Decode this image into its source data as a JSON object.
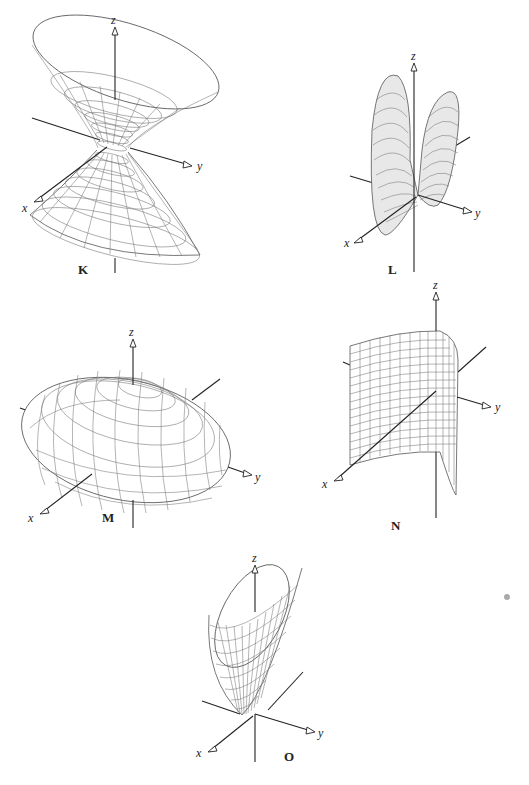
{
  "panels": [
    {
      "id": "K",
      "caption": "K",
      "surface": "hyperboloid of one sheet",
      "axes": {
        "x": "x",
        "y": "y",
        "z": "z"
      }
    },
    {
      "id": "L",
      "caption": "L",
      "surface": "elliptic cone (double lobes)",
      "axes": {
        "x": "x",
        "y": "y",
        "z": "z"
      }
    },
    {
      "id": "M",
      "caption": "M",
      "surface": "ellipsoid",
      "axes": {
        "x": "x",
        "y": "y",
        "z": "z"
      }
    },
    {
      "id": "N",
      "caption": "N",
      "surface": "parabolic cylinder",
      "axes": {
        "x": "x",
        "y": "y",
        "z": "z"
      }
    },
    {
      "id": "O",
      "caption": "O",
      "surface": "elliptic paraboloid",
      "axes": {
        "x": "x",
        "y": "y",
        "z": "z"
      }
    }
  ]
}
